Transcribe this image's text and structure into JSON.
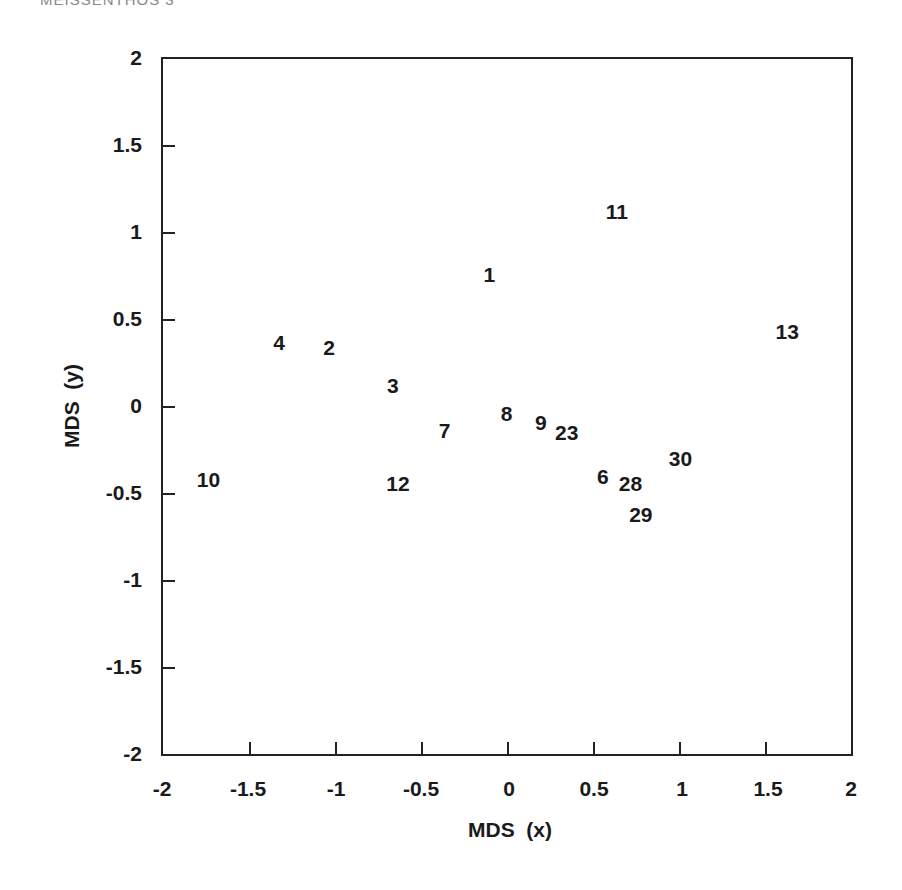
{
  "header": {
    "text": "MEISSENTHOS 3"
  },
  "chart_data": {
    "type": "scatter",
    "title": "",
    "xlabel": "MDS  (x)",
    "ylabel": "MDS  (y)",
    "xlim": [
      -2,
      2
    ],
    "ylim": [
      -2,
      2
    ],
    "grid": false,
    "legend": null,
    "x_ticks": [
      "-2",
      "-1.5",
      "-1",
      "-0.5",
      "0",
      "0.5",
      "1",
      "1.5",
      "2"
    ],
    "y_ticks": [
      "2",
      "1.5",
      "1",
      "0.5",
      "0",
      "-0.5",
      "-1",
      "-1.5",
      "-2"
    ],
    "marker": "text-label",
    "points": [
      {
        "label": "1",
        "x": -0.1,
        "y": 0.76
      },
      {
        "label": "2",
        "x": -1.03,
        "y": 0.34
      },
      {
        "label": "3",
        "x": -0.66,
        "y": 0.12
      },
      {
        "label": "4",
        "x": -1.32,
        "y": 0.37
      },
      {
        "label": "6",
        "x": 0.56,
        "y": -0.4
      },
      {
        "label": "7",
        "x": -0.36,
        "y": -0.14
      },
      {
        "label": "8",
        "x": 0.0,
        "y": -0.04
      },
      {
        "label": "9",
        "x": 0.2,
        "y": -0.09
      },
      {
        "label": "10",
        "x": -1.73,
        "y": -0.42
      },
      {
        "label": "11",
        "x": 0.64,
        "y": 1.12
      },
      {
        "label": "12",
        "x": -0.63,
        "y": -0.44
      },
      {
        "label": "13",
        "x": 1.63,
        "y": 0.43
      },
      {
        "label": "23",
        "x": 0.35,
        "y": -0.15
      },
      {
        "label": "28",
        "x": 0.72,
        "y": -0.44
      },
      {
        "label": "29",
        "x": 0.78,
        "y": -0.62
      },
      {
        "label": "30",
        "x": 1.01,
        "y": -0.3
      }
    ]
  },
  "axes": {
    "x_label": "MDS  (x)",
    "y_label": "MDS  (y)",
    "x_ticks": [
      "-2",
      "-1.5",
      "-1",
      "-0.5",
      "0",
      "0.5",
      "1",
      "1.5",
      "2"
    ],
    "y_ticks": [
      "2",
      "1.5",
      "1",
      "0.5",
      "0",
      "-0.5",
      "-1",
      "-1.5",
      "-2"
    ]
  },
  "caption": {
    "text": ""
  }
}
